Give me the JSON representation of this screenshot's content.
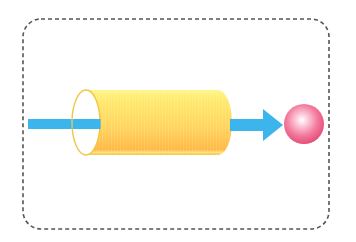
{
  "diagram": {
    "title": "",
    "frame": {
      "style": "dashed-rounded",
      "stroke": "#555555",
      "x": 23,
      "y": 19,
      "width": 306,
      "height": 210,
      "radius": 18
    },
    "elements": [
      {
        "id": "input-arrow",
        "type": "arrow-shaft",
        "color": "#3CB4EC",
        "from_x": 28,
        "to_x": 102,
        "y": 124
      },
      {
        "id": "tube",
        "type": "cylinder",
        "fill_top": "#FFEE78",
        "fill_bottom": "#FFBB48",
        "rim": "#F2C640",
        "x_left": 86,
        "x_right": 230,
        "y_top": 90,
        "y_bottom": 155
      },
      {
        "id": "output-arrow",
        "type": "arrow",
        "color": "#3CB4EC",
        "from_x": 230,
        "to_x": 283,
        "y": 125
      },
      {
        "id": "particle",
        "type": "sphere",
        "fill": "#F06A92",
        "highlight": "#FFFFFF",
        "cx": 304,
        "cy": 124,
        "r": 20
      }
    ],
    "labels": []
  }
}
